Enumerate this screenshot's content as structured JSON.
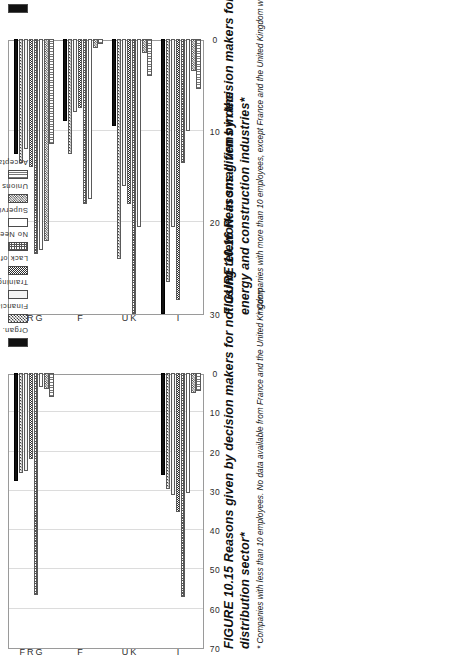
{
  "page": {
    "orientation": "rotated-90-ccw",
    "background": "#ffffff"
  },
  "legend": {
    "items": [
      {
        "key": "organ",
        "label": "Organ. Problems",
        "pattern": "solid-black"
      },
      {
        "key": "financial",
        "label": "Financial Problems",
        "pattern": "checker-medium"
      },
      {
        "key": "training",
        "label": "Training Need",
        "pattern": "light-gray"
      },
      {
        "key": "lack",
        "label": "Lack of Tech.",
        "pattern": "checker-dark"
      },
      {
        "key": "noneed",
        "label": "No Need to Change",
        "pattern": "cross-hatch"
      },
      {
        "key": "supervision",
        "label": "Supervision",
        "pattern": "white"
      },
      {
        "key": "unions",
        "label": "Unions",
        "pattern": "checker-dense"
      },
      {
        "key": "acceptance",
        "label": "Acceptance",
        "pattern": "vertical-lines"
      }
    ]
  },
  "figure_1015": {
    "caption_main": "FIGURE 10.15  Reasons given by decision makers for not using telework in small firms in the distribution sector*",
    "caption_note": "* Companies with less than 10 employees. No data available from France and the United Kingdom"
  },
  "figure_1016": {
    "caption_main": "FIGURE 10.16  Reasons given by decision makers for not using telework in the manufacturing, energy and construction industries*",
    "caption_note": "* Companies with more than 10 employees, except France and the United Kingdom where the data refer to companies"
  },
  "chart_data": [
    {
      "id": "fig-10-15",
      "type": "bar",
      "orientation": "horizontal-grouped",
      "title": "FIGURE 10.15  Reasons given by decision makers for not using telework in small firms in the distribution sector*",
      "xlabel": "",
      "ylabel": "",
      "ylim": [
        0,
        70
      ],
      "yticks": [
        0,
        10,
        20,
        30,
        40,
        50,
        60,
        70
      ],
      "grid": true,
      "legend_position": "top-right",
      "categories": [
        "I",
        "UK",
        "F",
        "FRG"
      ],
      "series": [
        {
          "name": "Organ. Problems",
          "values": [
            26.0,
            null,
            null,
            27.5
          ]
        },
        {
          "name": "Financial Problems",
          "values": [
            29.5,
            null,
            null,
            25.5
          ]
        },
        {
          "name": "Training Need",
          "values": [
            31.0,
            null,
            null,
            25.0
          ]
        },
        {
          "name": "Lack of Tech.",
          "values": [
            35.5,
            null,
            null,
            22.0
          ]
        },
        {
          "name": "No Need to Change",
          "values": [
            57.0,
            null,
            null,
            56.5
          ]
        },
        {
          "name": "Supervision",
          "values": [
            30.5,
            null,
            null,
            3.5
          ]
        },
        {
          "name": "Unions",
          "values": [
            5.0,
            null,
            null,
            4.0
          ]
        },
        {
          "name": "Acceptance",
          "values": [
            4.5,
            null,
            null,
            6.0
          ]
        }
      ],
      "note": "No data available from France and the United Kingdom"
    },
    {
      "id": "fig-10-16",
      "type": "bar",
      "orientation": "horizontal-grouped",
      "title": "FIGURE 10.16  Reasons given by decision makers for not using telework in the manufacturing, energy and construction industries*",
      "xlabel": "",
      "ylabel": "",
      "ylim": [
        0,
        30
      ],
      "yticks": [
        0,
        10,
        20,
        30
      ],
      "grid": true,
      "legend_position": "top-right",
      "categories": [
        "I",
        "UK",
        "F",
        "FRG"
      ],
      "series": [
        {
          "name": "Organ. Problems",
          "values": [
            30.0,
            9.5,
            9.0,
            12.5
          ]
        },
        {
          "name": "Financial Problems",
          "values": [
            26.5,
            24.0,
            12.5,
            13.5
          ]
        },
        {
          "name": "Training Need",
          "values": [
            20.5,
            16.0,
            8.0,
            12.0
          ]
        },
        {
          "name": "Lack of Tech.",
          "values": [
            28.5,
            18.0,
            7.5,
            14.0
          ]
        },
        {
          "name": "No Need to Change",
          "values": [
            13.5,
            30.0,
            18.0,
            23.5
          ]
        },
        {
          "name": "Supervision",
          "values": [
            10.0,
            20.5,
            17.5,
            23.0
          ]
        },
        {
          "name": "Unions",
          "values": [
            3.5,
            1.5,
            1.0,
            22.0
          ]
        },
        {
          "name": "Acceptance",
          "values": [
            5.5,
            4.0,
            0.5,
            11.5
          ]
        }
      ]
    }
  ]
}
